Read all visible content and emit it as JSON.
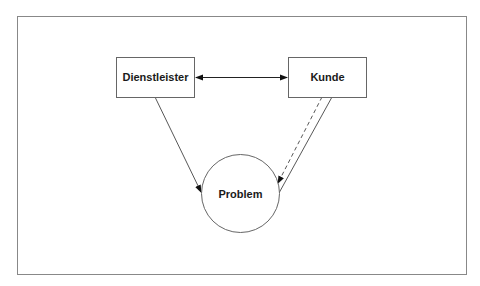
{
  "diagram": {
    "nodes": [
      {
        "id": "dienstleister",
        "label": "Dienstleister",
        "shape": "rectangle"
      },
      {
        "id": "kunde",
        "label": "Kunde",
        "shape": "rectangle"
      },
      {
        "id": "problem",
        "label": "Problem",
        "shape": "circle"
      }
    ],
    "edges": [
      {
        "from": "dienstleister",
        "to": "kunde",
        "style": "solid",
        "arrow": "both"
      },
      {
        "from": "dienstleister",
        "to": "problem",
        "style": "solid",
        "arrow": "end"
      },
      {
        "from": "kunde",
        "to": "problem",
        "style": "dashed",
        "arrow": "end"
      },
      {
        "from": "kunde",
        "to": "problem",
        "style": "solid",
        "arrow": "none"
      }
    ],
    "colors": {
      "stroke": "#555555",
      "frame": "#888888",
      "text": "#1a1a1a",
      "background": "#ffffff"
    }
  }
}
